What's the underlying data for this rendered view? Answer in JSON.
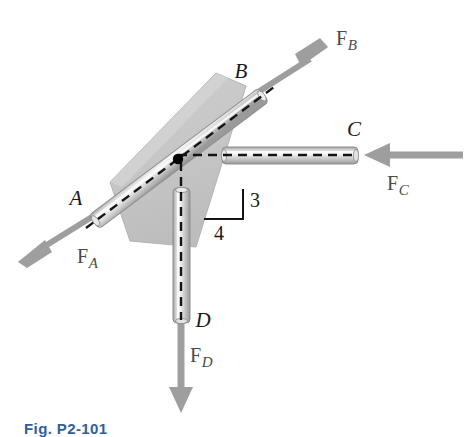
{
  "figure": {
    "caption": "Fig. P2-101",
    "background_color": "#ffffff"
  },
  "colors": {
    "plate_fill": "#c9c9c9",
    "plate_edge": "#b0b0b0",
    "rod_body": "#d8d8d8",
    "rod_edge": "#9a9a9a",
    "rod_highlight": "#f2f2f2",
    "arrow_gray": "#9e9e9e",
    "centerline": "#141414",
    "pivot_dot": "#000000",
    "label_text": "#1a1a1a",
    "force_text": "#4a4a4a",
    "caption_text": "#2f5f9e"
  },
  "joints": [
    {
      "id": "A",
      "label": "A",
      "x": 95,
      "y": 215,
      "label_x": 76,
      "label_y": 205
    },
    {
      "id": "B",
      "label": "B",
      "x": 261,
      "y": 90,
      "label_x": 241,
      "label_y": 78
    },
    {
      "id": "C",
      "label": "C",
      "x": 356,
      "y": 155,
      "label_x": 351,
      "label_y": 136
    },
    {
      "id": "D",
      "label": "D",
      "x": 181,
      "y": 322,
      "label_x": 196,
      "label_y": 326
    }
  ],
  "origin": {
    "label": "O",
    "x": 178,
    "y": 159
  },
  "forces": [
    {
      "id": "FA",
      "label_main": "F",
      "label_sub": "A",
      "direction": "down-left",
      "tail_x": 95,
      "tail_y": 215,
      "tip_x": 20,
      "tip_y": 261,
      "label_x": 77,
      "label_y": 262
    },
    {
      "id": "FB",
      "label_main": "F",
      "label_sub": "B",
      "direction": "up-right",
      "tail_x": 261,
      "tail_y": 90,
      "tip_x": 326,
      "tip_y": 48,
      "label_x": 336,
      "label_y": 44
    },
    {
      "id": "FC",
      "label_main": "F",
      "label_sub": "C",
      "direction": "left",
      "tail_x": 463,
      "tail_y": 155,
      "tip_x": 366,
      "tip_y": 155,
      "label_x": 393,
      "label_y": 187
    },
    {
      "id": "FD",
      "label_main": "F",
      "label_sub": "D",
      "direction": "down",
      "tail_x": 181,
      "tail_y": 322,
      "tip_x": 181,
      "tip_y": 411,
      "label_x": 192,
      "label_y": 358
    }
  ],
  "slope_triangle": {
    "rise_label": "3",
    "run_label": "4",
    "rise": 3,
    "run": 4,
    "corner_x": 243,
    "corner_y": 219,
    "top_x": 243,
    "top_y": 190,
    "left_x": 205,
    "left_y": 219,
    "rise_label_x": 249,
    "rise_label_y": 206,
    "run_label_x": 219,
    "run_label_y": 238
  },
  "members": [
    {
      "id": "rod-AB",
      "from": "A",
      "to": "B",
      "orientation": "diagonal-3-4"
    },
    {
      "id": "rod-OC",
      "from": "O",
      "to": "C",
      "orientation": "horizontal"
    },
    {
      "id": "rod-OD",
      "from": "O",
      "to": "D",
      "orientation": "vertical"
    }
  ],
  "plate": {
    "id": "gusset-plate",
    "points": "110,182 216,73 246,86 196,247 130,241"
  }
}
